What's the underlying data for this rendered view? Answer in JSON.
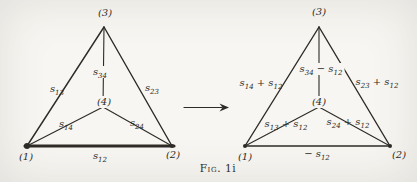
{
  "figure": {
    "caption_prefix": "Fig.",
    "caption_number": "1i"
  },
  "colors": {
    "paper": "#f7f6f2",
    "ink": "#2e2b26"
  },
  "arrow": {
    "x1": 184,
    "y1": 107.5,
    "x2": 229,
    "y2": 107.5
  },
  "diagrams": [
    {
      "id": "network-before",
      "edges": [
        {
          "name": "edge-1-3",
          "x1": 27,
          "y1": 146,
          "x2": 104,
          "y2": 27,
          "w": 1.4
        },
        {
          "name": "edge-2-3",
          "x1": 172,
          "y1": 146,
          "x2": 104,
          "y2": 27,
          "w": 1.4
        },
        {
          "name": "edge-1-2-bold",
          "x1": 25,
          "y1": 146,
          "x2": 174,
          "y2": 146,
          "w": 3.1
        },
        {
          "name": "spoke-3-4",
          "x1": 104,
          "y1": 27,
          "x2": 103,
          "y2": 107,
          "w": 1.1
        },
        {
          "name": "spoke-1-4",
          "x1": 27,
          "y1": 146,
          "x2": 103,
          "y2": 107,
          "w": 1.1
        },
        {
          "name": "spoke-2-4",
          "x1": 172,
          "y1": 146,
          "x2": 103,
          "y2": 107,
          "w": 1.1
        }
      ],
      "dots": [
        {
          "name": "vertex-1-dot",
          "x": 27,
          "y": 146,
          "r": 3.0
        },
        {
          "name": "vertex-2-dot",
          "x": 172,
          "y": 146,
          "r": 2.0
        }
      ],
      "labels": [
        {
          "name": "vertex-3-label",
          "text": "(3)",
          "x": 105,
          "y": 13,
          "kind": "node"
        },
        {
          "name": "vertex-1-label",
          "text": "(1)",
          "x": 26,
          "y": 157,
          "kind": "node"
        },
        {
          "name": "vertex-2-label",
          "text": "(2)",
          "x": 173,
          "y": 155,
          "kind": "node"
        },
        {
          "name": "vertex-4-label",
          "text": "(4)",
          "x": 104,
          "y": 102,
          "kind": "node",
          "mask": true
        },
        {
          "name": "edge-label-s13",
          "text": "s_{13}",
          "x": 57,
          "y": 89,
          "kind": "edge"
        },
        {
          "name": "edge-label-s23",
          "text": "s_{23}",
          "x": 152,
          "y": 88,
          "kind": "edge"
        },
        {
          "name": "edge-label-s34",
          "text": "s_{34}",
          "x": 100,
          "y": 72,
          "kind": "edge",
          "mask": true
        },
        {
          "name": "edge-label-s14",
          "text": "s_{14}",
          "x": 66,
          "y": 124,
          "kind": "edge"
        },
        {
          "name": "edge-label-s24",
          "text": "s_{24}",
          "x": 137,
          "y": 123,
          "kind": "edge"
        },
        {
          "name": "edge-label-s12",
          "text": "s_{12}",
          "x": 100,
          "y": 156,
          "kind": "edge"
        }
      ]
    },
    {
      "id": "network-after",
      "edges": [
        {
          "name": "edge-1-3",
          "x1": 245,
          "y1": 146,
          "x2": 319,
          "y2": 27,
          "w": 1.4
        },
        {
          "name": "edge-2-3",
          "x1": 390,
          "y1": 146,
          "x2": 319,
          "y2": 27,
          "w": 1.4
        },
        {
          "name": "edge-1-2",
          "x1": 245,
          "y1": 146,
          "x2": 390,
          "y2": 146,
          "w": 1.7
        },
        {
          "name": "spoke-3-4",
          "x1": 319,
          "y1": 27,
          "x2": 319,
          "y2": 107,
          "w": 1.1
        },
        {
          "name": "spoke-1-4",
          "x1": 245,
          "y1": 146,
          "x2": 319,
          "y2": 107,
          "w": 1.1
        },
        {
          "name": "spoke-2-4",
          "x1": 390,
          "y1": 146,
          "x2": 319,
          "y2": 107,
          "w": 1.1
        }
      ],
      "dots": [
        {
          "name": "vertex-1-dot",
          "x": 245,
          "y": 146,
          "r": 2.0
        },
        {
          "name": "vertex-2-dot",
          "x": 390,
          "y": 146,
          "r": 2.0
        }
      ],
      "labels": [
        {
          "name": "vertex-3-label",
          "text": "(3)",
          "x": 319,
          "y": 12,
          "kind": "node"
        },
        {
          "name": "vertex-1-label",
          "text": "(1)",
          "x": 245,
          "y": 157,
          "kind": "node"
        },
        {
          "name": "vertex-2-label",
          "text": "(2)",
          "x": 399,
          "y": 155,
          "kind": "node"
        },
        {
          "name": "vertex-4-label",
          "text": "(4)",
          "x": 319,
          "y": 102,
          "kind": "node",
          "mask": true
        },
        {
          "name": "edge-label-s14-plus-s12",
          "text": "s_{14} + s_{12}",
          "x": 261,
          "y": 83,
          "kind": "edge"
        },
        {
          "name": "edge-label-s23-plus-s12",
          "text": "s_{23} + s_{12}",
          "x": 377,
          "y": 82,
          "kind": "edge"
        },
        {
          "name": "edge-label-s34-minus-s12",
          "text": "s_{34} − s_{12}",
          "x": 321,
          "y": 69,
          "kind": "edge",
          "mask": true
        },
        {
          "name": "edge-label-s13-plus-s12",
          "text": "s_{13} + s_{12}",
          "x": 286,
          "y": 124,
          "kind": "edge"
        },
        {
          "name": "edge-label-s24-plus-s12",
          "text": "s_{24} + s_{12}",
          "x": 348,
          "y": 122,
          "kind": "edge"
        },
        {
          "name": "edge-label-minus-s12",
          "text": "− s_{12}",
          "x": 317,
          "y": 154,
          "kind": "edge"
        }
      ]
    }
  ]
}
